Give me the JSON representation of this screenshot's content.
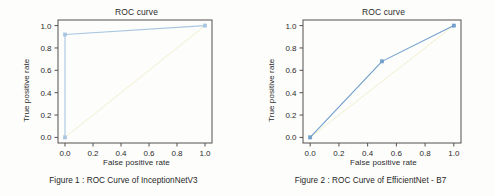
{
  "page": {
    "background_color": "#fdfdfc",
    "figure_count": 2
  },
  "figures": [
    {
      "caption": "Figure 1 : ROC Curve of InceptionNetV3",
      "title": "ROC curve",
      "xlabel": "False positive rate",
      "ylabel": "True positive rate"
    },
    {
      "caption": "Figure 2 : ROC Curve of EfficientNet - B7",
      "title": "ROC curve",
      "xlabel": "False positive rate",
      "ylabel": "True positive rate"
    }
  ],
  "chart_data": [
    {
      "type": "line",
      "title": "ROC curve",
      "xlabel": "False positive rate",
      "ylabel": "True positive rate",
      "xlim": [
        -0.05,
        1.05
      ],
      "ylim": [
        -0.05,
        1.05
      ],
      "xticks": [
        0.0,
        0.2,
        0.4,
        0.6,
        0.8,
        1.0
      ],
      "yticks": [
        0.0,
        0.2,
        0.4,
        0.6,
        0.8,
        1.0
      ],
      "xtick_labels": [
        "0.0",
        "0.2",
        "0.4",
        "0.6",
        "0.8",
        "1.0"
      ],
      "ytick_labels": [
        "0.0",
        "0.2",
        "0.4",
        "0.6",
        "0.8",
        "1.0"
      ],
      "grid": false,
      "legend": null,
      "series": [
        {
          "name": "ROC curve",
          "color": "#a8c6e0",
          "marker": "square",
          "x": [
            0.0,
            0.0,
            1.0
          ],
          "y": [
            0.0,
            0.92,
            1.0
          ]
        },
        {
          "name": "chance diagonal",
          "color": "#f2f0cf",
          "marker": "none",
          "x": [
            0.0,
            1.0
          ],
          "y": [
            0.0,
            1.0
          ]
        }
      ]
    },
    {
      "type": "line",
      "title": "ROC curve",
      "xlabel": "False positive rate",
      "ylabel": "True positive rate",
      "xlim": [
        -0.05,
        1.05
      ],
      "ylim": [
        -0.05,
        1.05
      ],
      "xticks": [
        0.0,
        0.2,
        0.4,
        0.6,
        0.8,
        1.0
      ],
      "yticks": [
        0.0,
        0.2,
        0.4,
        0.6,
        0.8,
        1.0
      ],
      "xtick_labels": [
        "0.0",
        "0.2",
        "0.4",
        "0.6",
        "0.8",
        "1.0"
      ],
      "ytick_labels": [
        "0.0",
        "0.2",
        "0.4",
        "0.6",
        "0.8",
        "1.0"
      ],
      "grid": false,
      "legend": null,
      "series": [
        {
          "name": "ROC curve",
          "color": "#6f9ecb",
          "marker": "square",
          "x": [
            0.0,
            0.5,
            1.0
          ],
          "y": [
            0.0,
            0.68,
            1.0
          ]
        },
        {
          "name": "chance diagonal",
          "color": "#f2f0cf",
          "marker": "none",
          "x": [
            0.0,
            1.0
          ],
          "y": [
            0.0,
            1.0
          ]
        }
      ]
    }
  ],
  "style": {
    "axis_color": "#55504c",
    "tick_color": "#55504c",
    "text_color": "#2b2b2b"
  }
}
